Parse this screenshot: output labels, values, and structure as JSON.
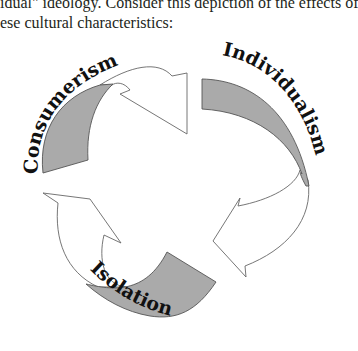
{
  "intro": {
    "line1": "idual\" ideology. Consider this depiction of the effects of",
    "line2": "ese cultural characteristics:"
  },
  "diagram": {
    "type": "cycle",
    "fill_color": "#aaaaaa",
    "stroke_color": "#555555",
    "stages": [
      {
        "label": "Consumerism",
        "position": "top-left",
        "arrow_points_to": "Individualism"
      },
      {
        "label": "Individualism",
        "position": "right",
        "arrow_points_to": "Isolation"
      },
      {
        "label": "Isolation",
        "position": "bottom",
        "arrow_points_to": "Consumerism"
      }
    ]
  }
}
